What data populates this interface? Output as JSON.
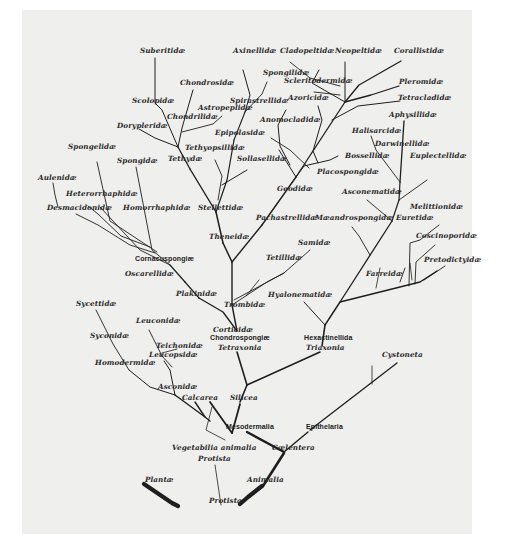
{
  "diagram": {
    "type": "phylogenetic-tree",
    "colors": {
      "background": "#efefed",
      "ink": "#1e1e1e"
    },
    "labels": [
      {
        "id": "suberitidae",
        "text": "Suberitidæ",
        "x": 140,
        "y": 51
      },
      {
        "id": "chondrosidae",
        "text": "Chondrosidæ",
        "x": 180,
        "y": 83
      },
      {
        "id": "scolopidae",
        "text": "Scolopidæ",
        "x": 132,
        "y": 101
      },
      {
        "id": "astropeplidae",
        "text": "Astropeplidæ",
        "x": 198,
        "y": 108
      },
      {
        "id": "chondrilidae",
        "text": "Chondrilidæ",
        "x": 167,
        "y": 117
      },
      {
        "id": "dorypleridae",
        "text": "Dorypleridæ",
        "x": 117,
        "y": 126
      },
      {
        "id": "axinellidae",
        "text": "Axinellidæ",
        "x": 233,
        "y": 51
      },
      {
        "id": "spongilidae",
        "text": "Spongilidæ",
        "x": 263,
        "y": 73
      },
      {
        "id": "spirastrellidae",
        "text": "Spirastrellidæ",
        "x": 230,
        "y": 101
      },
      {
        "id": "epipolasidae",
        "text": "Epipolasidæ",
        "x": 215,
        "y": 133
      },
      {
        "id": "tethyopsillidae",
        "text": "Tethyopsillidæ",
        "x": 185,
        "y": 148
      },
      {
        "id": "tethydae",
        "text": "Tethydæ",
        "x": 168,
        "y": 159
      },
      {
        "id": "sollasellidae",
        "text": "Sollasellidæ",
        "x": 237,
        "y": 159
      },
      {
        "id": "cladopeltidae",
        "text": "Cladopeltidæ",
        "x": 280,
        "y": 51
      },
      {
        "id": "neopeltidae",
        "text": "Neopeltidæ",
        "x": 335,
        "y": 51
      },
      {
        "id": "corallistidae",
        "text": "Corallistidæ",
        "x": 394,
        "y": 51
      },
      {
        "id": "scleritodermidae",
        "text": "Scleritodermidæ",
        "x": 284,
        "y": 81
      },
      {
        "id": "pleromidae",
        "text": "Pleromidæ",
        "x": 399,
        "y": 82
      },
      {
        "id": "azoricidae",
        "text": "Azoricidæ",
        "x": 288,
        "y": 98
      },
      {
        "id": "tetracladidae",
        "text": "Tetracladidæ",
        "x": 398,
        "y": 98
      },
      {
        "id": "anomocladidae",
        "text": "Anomocladidæ",
        "x": 260,
        "y": 120
      },
      {
        "id": "aphysillidae",
        "text": "Aphysillidæ",
        "x": 389,
        "y": 115
      },
      {
        "id": "halisarcidae",
        "text": "Halisarcidæ",
        "x": 352,
        "y": 131
      },
      {
        "id": "darwinellidae",
        "text": "Darwinellidæ",
        "x": 375,
        "y": 144
      },
      {
        "id": "bossellidae",
        "text": "Bossellidæ",
        "x": 345,
        "y": 156
      },
      {
        "id": "euplectellidae",
        "text": "Euplectellidæ",
        "x": 410,
        "y": 156
      },
      {
        "id": "placospongidae",
        "text": "Placospongidæ",
        "x": 317,
        "y": 172
      },
      {
        "id": "geodidae",
        "text": "Geodidæ",
        "x": 277,
        "y": 189
      },
      {
        "id": "asconematidae",
        "text": "Asconematidæ",
        "x": 342,
        "y": 192
      },
      {
        "id": "melittionidae",
        "text": "Melittionidæ",
        "x": 410,
        "y": 207
      },
      {
        "id": "pachastrellidae",
        "text": "Pachastrellidæ",
        "x": 256,
        "y": 218
      },
      {
        "id": "maeandrospongidae",
        "text": "Mæandrospongidæ",
        "x": 315,
        "y": 218
      },
      {
        "id": "euretidae",
        "text": "Euretidæ",
        "x": 396,
        "y": 218
      },
      {
        "id": "coscinoporidae",
        "text": "Coscinoporidæ",
        "x": 416,
        "y": 236
      },
      {
        "id": "samidae",
        "text": "Samidæ",
        "x": 298,
        "y": 243
      },
      {
        "id": "tetillidae",
        "text": "Tetillidæ",
        "x": 266,
        "y": 258
      },
      {
        "id": "pretodictyidae",
        "text": "Pretodictyidæ",
        "x": 424,
        "y": 260
      },
      {
        "id": "farreidae",
        "text": "Farreidæ",
        "x": 366,
        "y": 274
      },
      {
        "id": "spongelidae",
        "text": "Spongelidæ",
        "x": 68,
        "y": 147
      },
      {
        "id": "spongidae",
        "text": "Spongidæ",
        "x": 117,
        "y": 161
      },
      {
        "id": "aulenidae",
        "text": "Aulenidæ",
        "x": 38,
        "y": 178
      },
      {
        "id": "heterorrhaphidae",
        "text": "Heterorrhaphidæ",
        "x": 66,
        "y": 194
      },
      {
        "id": "desmacidonidae",
        "text": "Desmacidonidæ",
        "x": 47,
        "y": 208
      },
      {
        "id": "homorrhaphidae",
        "text": "Homorrhaphidæ",
        "x": 123,
        "y": 208
      },
      {
        "id": "stellettidae",
        "text": "Stellettidæ",
        "x": 198,
        "y": 208
      },
      {
        "id": "theneidae",
        "text": "Theneidæ",
        "x": 209,
        "y": 237
      },
      {
        "id": "cornacuspongiae",
        "text": "Cornacuspongiæ",
        "x": 135,
        "y": 259,
        "group": true
      },
      {
        "id": "oscarellidae",
        "text": "Oscarellidæ",
        "x": 125,
        "y": 274
      },
      {
        "id": "plakinidae",
        "text": "Plakinidæ",
        "x": 176,
        "y": 294
      },
      {
        "id": "trombidae",
        "text": "Trombidæ",
        "x": 224,
        "y": 305
      },
      {
        "id": "hyalonematidae",
        "text": "Hyalonematidæ",
        "x": 268,
        "y": 295
      },
      {
        "id": "sycettidae",
        "text": "Sycettidæ",
        "x": 76,
        "y": 304
      },
      {
        "id": "leuconidae",
        "text": "Leuconidæ",
        "x": 136,
        "y": 321
      },
      {
        "id": "corticidae",
        "text": "Corticidæ",
        "x": 213,
        "y": 330
      },
      {
        "id": "chondrospongiae",
        "text": "Chondrospongiæ",
        "x": 210,
        "y": 338,
        "group": true
      },
      {
        "id": "hexactinellida",
        "text": "Hexactinellida",
        "x": 304,
        "y": 338,
        "group": true
      },
      {
        "id": "syconidae",
        "text": "Syconidæ",
        "x": 90,
        "y": 336
      },
      {
        "id": "teichonidae",
        "text": "Teichonidæ",
        "x": 156,
        "y": 346
      },
      {
        "id": "tetraxonia",
        "text": "Tetraxonia",
        "x": 218,
        "y": 348
      },
      {
        "id": "triaxonia",
        "text": "Triaxonia",
        "x": 306,
        "y": 348
      },
      {
        "id": "leucopsidae",
        "text": "Leucopsidæ",
        "x": 149,
        "y": 355
      },
      {
        "id": "cystoneta",
        "text": "Cystoneta",
        "x": 382,
        "y": 355
      },
      {
        "id": "homodermidae",
        "text": "Homodermidæ",
        "x": 95,
        "y": 363
      },
      {
        "id": "asconidae",
        "text": "Asconidæ",
        "x": 158,
        "y": 387
      },
      {
        "id": "calcarea",
        "text": "Calcarea",
        "x": 182,
        "y": 398
      },
      {
        "id": "silicea",
        "text": "Silicea",
        "x": 230,
        "y": 398
      },
      {
        "id": "mesodermalia",
        "text": "Mesodermalia",
        "x": 226,
        "y": 427,
        "group": true
      },
      {
        "id": "epithelaria",
        "text": "Epithelaria",
        "x": 306,
        "y": 427,
        "group": true
      },
      {
        "id": "vegetabilia-animalia",
        "text": "Vegetabilia animalia",
        "x": 172,
        "y": 448
      },
      {
        "id": "coelentera",
        "text": "Cœlentera",
        "x": 272,
        "y": 448
      },
      {
        "id": "protista-upper",
        "text": "Protista",
        "x": 198,
        "y": 459
      },
      {
        "id": "plantae",
        "text": "Plantæ",
        "x": 145,
        "y": 480
      },
      {
        "id": "animalia",
        "text": "Animalia",
        "x": 247,
        "y": 480
      },
      {
        "id": "protista-root",
        "text": "Protista",
        "x": 209,
        "y": 501
      }
    ],
    "edges": [
      {
        "d": "M178 506 L172 503 L144 484",
        "w": 4.2
      },
      {
        "d": "M240 504 L248 497 L262 486",
        "w": 4.2
      },
      {
        "d": "M221 505 L215 465",
        "w": 0.8
      },
      {
        "d": "M263 486 L284 453",
        "w": 2.6
      },
      {
        "d": "M284 452 L247 432",
        "w": 2.4
      },
      {
        "d": "M284 452 L308 432",
        "w": 1.4
      },
      {
        "d": "M310 430 L397 363",
        "w": 1.3
      },
      {
        "d": "M372 384 L372 366",
        "w": 0.8
      },
      {
        "d": "M232 433 L210 402",
        "w": 1.8
      },
      {
        "d": "M232 433 L240 404",
        "w": 1.8
      },
      {
        "d": "M240 402 L247 385",
        "w": 1.6
      },
      {
        "d": "M247 385 L237 352",
        "w": 1.6
      },
      {
        "d": "M247 385 L320 352",
        "w": 1.6
      },
      {
        "d": "M322 346 L325 325",
        "w": 1.6
      },
      {
        "d": "M325 325 L304 302",
        "w": 1.0
      },
      {
        "d": "M325 325 L340 302 L420 282 L437 271",
        "w": 1.4
      },
      {
        "d": "M376 288 L380 268",
        "w": 0.8
      },
      {
        "d": "M400 282 L405 268",
        "w": 0.9
      },
      {
        "d": "M412 280 L410 263",
        "w": 0.8
      },
      {
        "d": "M340 302 L392 221",
        "w": 1.3
      },
      {
        "d": "M370 255 L359 236 L352 227",
        "w": 0.9
      },
      {
        "d": "M392 221 L399 200",
        "w": 1.2
      },
      {
        "d": "M392 221 L367 200",
        "w": 0.9
      },
      {
        "d": "M399 200 L427 180",
        "w": 0.9
      },
      {
        "d": "M399 200 L400 182",
        "w": 1.2
      },
      {
        "d": "M400 182 L376 150 L371 136",
        "w": 0.9
      },
      {
        "d": "M400 182 L404 121",
        "w": 1.3
      },
      {
        "d": "M409 286 L410 243 L420 240 L439 225",
        "w": 0.9
      },
      {
        "d": "M415 284 L416 262 L435 245",
        "w": 0.9
      },
      {
        "d": "M424 280 L445 266",
        "w": 0.9
      },
      {
        "d": "M237 331 L232 305",
        "w": 1.4
      },
      {
        "d": "M232 305 L232 262",
        "w": 1.4
      },
      {
        "d": "M232 305 L267 282 L284 273",
        "w": 0.9
      },
      {
        "d": "M234 300 L284 273 L310 250",
        "w": 0.9
      },
      {
        "d": "M246 296 L259 280",
        "w": 0.8
      },
      {
        "d": "M232 262 L223 243",
        "w": 1.5
      },
      {
        "d": "M232 262 L262 225",
        "w": 1.4
      },
      {
        "d": "M262 225 L296 177",
        "w": 1.4
      },
      {
        "d": "M296 177 L304 166 L330 160 L338 156",
        "w": 1.0
      },
      {
        "d": "M296 177 L345 102 L371 95 L399 86",
        "w": 1.3
      },
      {
        "d": "M332 120 L358 106 L400 101",
        "w": 1.0
      },
      {
        "d": "M345 102 L359 85 L401 61",
        "w": 1.3
      },
      {
        "d": "M290 165 L280 146 L278 125 L286 110",
        "w": 1.0
      },
      {
        "d": "M296 177 L279 150",
        "w": 1.0
      },
      {
        "d": "M318 163 L313 151 L322 120 L318 106",
        "w": 1.0
      },
      {
        "d": "M309 168 L290 150 L271 138",
        "w": 0.9
      },
      {
        "d": "M345 102 L345 62",
        "w": 1.0
      },
      {
        "d": "M345 102 L312 83 L319 70",
        "w": 1.0
      },
      {
        "d": "M340 95 L314 92",
        "w": 0.9
      },
      {
        "d": "M340 86 L310 78 L290 62",
        "w": 0.9
      },
      {
        "d": "M223 243 L216 212",
        "w": 1.5
      },
      {
        "d": "M216 212 L190 169",
        "w": 1.4
      },
      {
        "d": "M216 212 L227 180 L234 140",
        "w": 1.2
      },
      {
        "d": "M222 185 L247 170",
        "w": 1.0
      },
      {
        "d": "M234 140 L245 112",
        "w": 1.1
      },
      {
        "d": "M245 112 L250 95 L243 70",
        "w": 1.0
      },
      {
        "d": "M245 112 L262 94 L267 82",
        "w": 0.9
      },
      {
        "d": "M218 200 L222 176 L215 160",
        "w": 0.9
      },
      {
        "d": "M190 169 L178 147",
        "w": 1.3
      },
      {
        "d": "M178 147 L162 110 L155 103 L155 58",
        "w": 1.0
      },
      {
        "d": "M178 147 L182 128 L193 90",
        "w": 1.0
      },
      {
        "d": "M182 132 L213 124 L222 116",
        "w": 0.9
      },
      {
        "d": "M178 147 L155 138 L139 129",
        "w": 1.0
      },
      {
        "d": "M237 331 L223 312 L199 298",
        "w": 1.3
      },
      {
        "d": "M199 298 L185 282",
        "w": 1.2
      },
      {
        "d": "M185 282 L170 265",
        "w": 1.2
      },
      {
        "d": "M170 265 L152 250 L136 167",
        "w": 0.9
      },
      {
        "d": "M170 265 L140 250 L100 207",
        "w": 0.9
      },
      {
        "d": "M157 252 L110 221 L97 162",
        "w": 0.9
      },
      {
        "d": "M150 247 L121 236 L98 214 L88 206",
        "w": 0.9
      },
      {
        "d": "M155 253 L130 245 L98 225 L76 214",
        "w": 0.9
      },
      {
        "d": "M58 207 L55 195 L53 183",
        "w": 0.9
      },
      {
        "d": "M205 417 L195 402",
        "w": 1.4
      },
      {
        "d": "M210 421 L205 417 L186 403 L175 395",
        "w": 1.4
      },
      {
        "d": "M175 395 L170 370 L164 361",
        "w": 1.0
      },
      {
        "d": "M172 367 L162 356 L149 330",
        "w": 0.9
      },
      {
        "d": "M162 353 L177 349",
        "w": 0.8
      },
      {
        "d": "M175 395 L150 387 L129 370",
        "w": 1.0
      },
      {
        "d": "M129 370 L113 344 L96 310",
        "w": 0.9
      },
      {
        "d": "M212 407 L206 430 L225 440",
        "w": 0.8
      }
    ]
  }
}
